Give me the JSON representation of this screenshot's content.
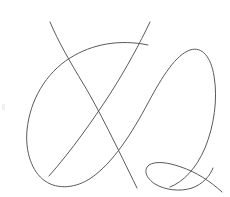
{
  "canvas": {
    "width": 230,
    "height": 197,
    "background_color": "#ffffff",
    "title": "Hand-drawn line sketch"
  },
  "drawing": {
    "name": "abstract-q-sketch",
    "description": "Single-color thin line drawing: a large ovoid loop crossed by two long diagonal strokes forming an X, with a small pointed tail loop at lower right",
    "stroke_color": "#5a5a5e",
    "stroke_width": 1,
    "stroke_count": 3,
    "strokes": [
      {
        "name": "large-ovoid-loop",
        "label": "Large ovoid loop",
        "path": "M 148 45 C 120 39 92 44 70 58 C 46 73 30 100 27 130 C 25 152 32 172 45 181 C 58 190 76 188 91 178 C 113 163 132 133 148 103 C 163 75 176 55 190 50 C 202 46 211 57 214 76 C 218 99 214 126 205 148 C 196 169 183 182 170 187",
        "closed": false
      },
      {
        "name": "diagonal-stroke-left",
        "label": "Left diagonal stroke",
        "path": "M 50 22 C 58 41 70 62 84 85 C 99 110 117 147 137 188",
        "closed": false
      },
      {
        "name": "diagonal-stroke-right",
        "label": "Right diagonal stroke and tail loop",
        "path": "M 150 22 C 140 43 126 69 110 94 C 93 120 72 150 49 176",
        "closed": false
      },
      {
        "name": "tail-loop",
        "label": "Small pointed tail loop",
        "path": "M 222 192 C 210 181 196 172 181 167 C 167 162 155 161 149 165 C 143 170 146 178 155 184 C 165 190 180 192 192 188 C 203 184 210 176 213 168",
        "closed": false
      }
    ]
  },
  "artifacts": [
    {
      "name": "edge-speck",
      "x": 2,
      "y": 104,
      "width": 3,
      "height": 6,
      "color": "#f0f0f0"
    }
  ]
}
